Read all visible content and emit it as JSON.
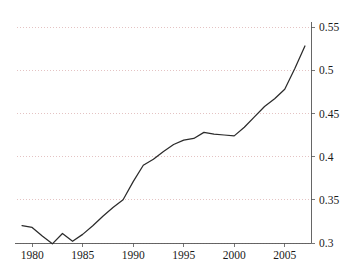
{
  "chart_data": {
    "type": "line",
    "title": "",
    "subtitle": "",
    "xlabel": "",
    "ylabel": "",
    "xlim": [
      1978.5,
      2007.6
    ],
    "ylim": [
      0.295,
      0.558
    ],
    "grid": true,
    "grid_axis": "y",
    "legend": false,
    "legend_position": "none",
    "line_color": "#2b2b2b",
    "grid_color": "#d8a9a9",
    "axis_color": "#555555",
    "x_tick_labels": [
      "1980",
      "1985",
      "1990",
      "1995",
      "2000",
      "2005"
    ],
    "x_tick_values": [
      1980,
      1985,
      1990,
      1995,
      2000,
      2005
    ],
    "y_tick_labels": [
      "0.3",
      "0.35",
      "0.4",
      "0.45",
      "0.5",
      "0.55"
    ],
    "y_tick_values": [
      0.3,
      0.35,
      0.4,
      0.45,
      0.5,
      0.55
    ],
    "x": [
      1979,
      1980,
      1981,
      1982,
      1983,
      1984,
      1985,
      1986,
      1987,
      1988,
      1989,
      1990,
      1991,
      1992,
      1993,
      1994,
      1995,
      1996,
      1997,
      1998,
      1999,
      2000,
      2001,
      2002,
      2003,
      2004,
      2005,
      2006,
      2007
    ],
    "series": [
      {
        "name": "value",
        "values": [
          0.32,
          0.318,
          0.308,
          0.299,
          0.311,
          0.302,
          0.31,
          0.32,
          0.331,
          0.341,
          0.35,
          0.371,
          0.39,
          0.397,
          0.406,
          0.414,
          0.419,
          0.421,
          0.428,
          0.426,
          0.425,
          0.424,
          0.434,
          0.446,
          0.458,
          0.467,
          0.478,
          0.502,
          0.528
        ]
      }
    ]
  },
  "axes": {
    "y_axis_name": "y-axis",
    "x_axis_name": "x-axis"
  }
}
